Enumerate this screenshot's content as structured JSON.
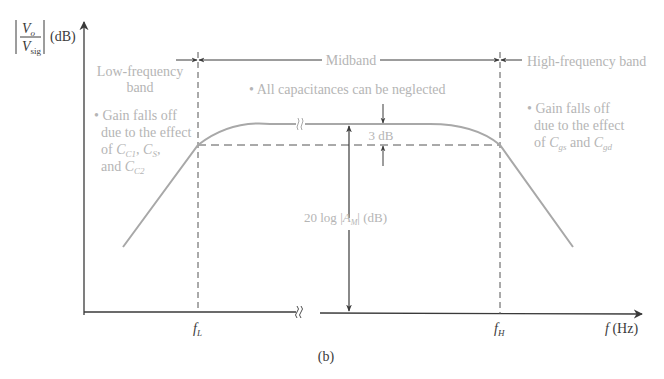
{
  "figure": {
    "caption": "(b)",
    "y_axis": {
      "num": "V",
      "num_sub": "o",
      "den": "V",
      "den_sub": "sig",
      "unit": "(dB)"
    },
    "x_axis": {
      "label_var": "f",
      "label_unit": "(Hz)",
      "fL": "f",
      "fL_sub": "L",
      "fH": "f",
      "fH_sub": "H"
    },
    "bands": {
      "low": {
        "line1": "Low-frequency",
        "line2": "band"
      },
      "mid": {
        "label": "Midband"
      },
      "high": {
        "label": "High-frequency band"
      }
    },
    "notes": {
      "low": {
        "line1": "• Gain falls off",
        "line2": "due to the effect",
        "line3_prefix": "of ",
        "c1": "C",
        "c1_sub": "C1",
        "sep1": ", ",
        "c2": "C",
        "c2_sub": "S",
        "sep2": ",",
        "line4_prefix": "and ",
        "c3": "C",
        "c3_sub": "C2"
      },
      "mid": {
        "text": "• All capacitances can be neglected"
      },
      "high": {
        "line1": "• Gain falls off",
        "line2": "due to the effect",
        "line3_prefix": "of ",
        "c1": "C",
        "c1_sub": "gs",
        "mid": " and ",
        "c2": "C",
        "c2_sub": "gd"
      }
    },
    "annotations": {
      "three_db": "3 dB",
      "gain_prefix": "20 log ",
      "gain_var": "A",
      "gain_sub": "M",
      "gain_unit": " (dB)"
    },
    "colors": {
      "axis": "#3a3a3a",
      "curve": "#a8a8a8",
      "text_gray": "#b5b5b5",
      "dashed": "#555555"
    }
  }
}
